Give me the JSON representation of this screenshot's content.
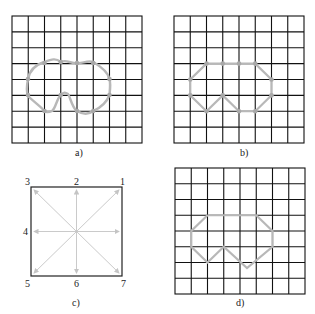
{
  "panels": {
    "a": {
      "caption": "a)"
    },
    "b": {
      "caption": "b)"
    },
    "c": {
      "caption": "c)",
      "direction_labels": [
        "1",
        "2",
        "3",
        "4",
        "5",
        "6",
        "7"
      ]
    },
    "d": {
      "caption": "d)"
    }
  },
  "grid": {
    "cols": 8,
    "rows": 8
  },
  "colors": {
    "grid": "#111111",
    "curve": "#b8b8b8",
    "node": "#a8a8a8",
    "arrow": "#c4c4c4",
    "border": "#222222"
  }
}
